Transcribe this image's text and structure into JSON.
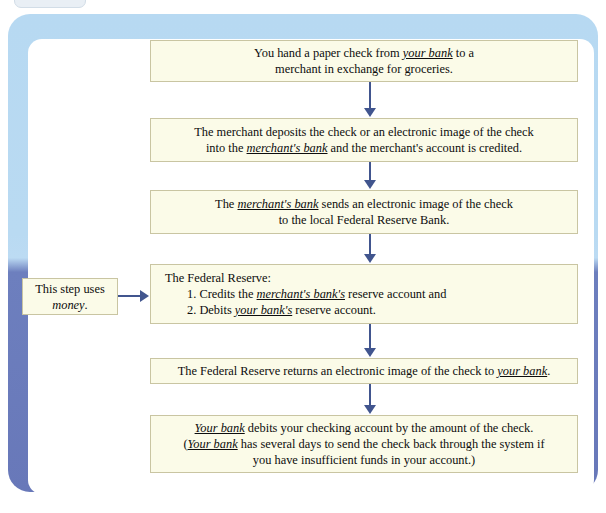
{
  "figure": {
    "type": "flowchart",
    "orientation": "vertical",
    "frame_color_top": "#b7d9f2",
    "frame_color_bottom": "#6878b9",
    "box_fill": "#fbfbe8",
    "box_border": "#c9c5a2",
    "arrow_color": "#41558e"
  },
  "top_tab": {
    "label": ""
  },
  "steps": [
    {
      "id": "step-1",
      "lines": [
        [
          {
            "text": "You hand a paper check from ",
            "style": "plain"
          },
          {
            "text": "your bank",
            "style": "term"
          },
          {
            "text": " to a",
            "style": "plain"
          }
        ],
        [
          {
            "text": "merchant in exchange for groceries.",
            "style": "plain"
          }
        ]
      ]
    },
    {
      "id": "step-2",
      "lines": [
        [
          {
            "text": "The merchant deposits the check or an electronic image of the check",
            "style": "plain"
          }
        ],
        [
          {
            "text": "into the ",
            "style": "plain"
          },
          {
            "text": "merchant's bank",
            "style": "term"
          },
          {
            "text": " and the merchant's account is credited.",
            "style": "plain"
          }
        ]
      ]
    },
    {
      "id": "step-3",
      "lines": [
        [
          {
            "text": "The ",
            "style": "plain"
          },
          {
            "text": "merchant's bank",
            "style": "term"
          },
          {
            "text": " sends an electronic image of the check",
            "style": "plain"
          }
        ],
        [
          {
            "text": "to the local Federal Reserve Bank.",
            "style": "plain"
          }
        ]
      ]
    },
    {
      "id": "step-4",
      "align": "left",
      "lines": [
        [
          {
            "text": "The Federal Reserve:",
            "style": "plain"
          }
        ],
        [
          {
            "text": "1. Credits the ",
            "style": "plain",
            "indent": true
          },
          {
            "text": "merchant's bank's",
            "style": "term"
          },
          {
            "text": " reserve account and",
            "style": "plain"
          }
        ],
        [
          {
            "text": "2. Debits ",
            "style": "plain",
            "indent": true
          },
          {
            "text": "your bank's",
            "style": "term"
          },
          {
            "text": " reserve account.",
            "style": "plain"
          }
        ]
      ]
    },
    {
      "id": "step-5",
      "lines": [
        [
          {
            "text": "The Federal Reserve returns an electronic image of the check to ",
            "style": "plain"
          },
          {
            "text": "your bank",
            "style": "term"
          },
          {
            "text": ".",
            "style": "plain"
          }
        ]
      ]
    },
    {
      "id": "step-6",
      "lines": [
        [
          {
            "text": "Your bank",
            "style": "term"
          },
          {
            "text": " debits your checking account by the amount of the check.",
            "style": "plain"
          }
        ],
        [
          {
            "text": "(",
            "style": "plain"
          },
          {
            "text": "Your bank",
            "style": "term"
          },
          {
            "text": " has several days to send the check back through the system if",
            "style": "plain"
          }
        ],
        [
          {
            "text": "you have insufficient funds in your account.)",
            "style": "plain"
          }
        ]
      ]
    }
  ],
  "callout": {
    "id": "callout-money",
    "lines": [
      [
        {
          "text": "This step uses",
          "style": "plain"
        }
      ],
      [
        {
          "text": "money",
          "style": "italic"
        },
        {
          "text": ".",
          "style": "plain"
        }
      ]
    ],
    "points_to": "step-4"
  },
  "arrows": [
    {
      "id": "arrow-1",
      "from": "step-1",
      "to": "step-2",
      "direction": "down"
    },
    {
      "id": "arrow-2",
      "from": "step-2",
      "to": "step-3",
      "direction": "down"
    },
    {
      "id": "arrow-3",
      "from": "step-3",
      "to": "step-4",
      "direction": "down"
    },
    {
      "id": "arrow-4",
      "from": "step-4",
      "to": "step-5",
      "direction": "down"
    },
    {
      "id": "arrow-5",
      "from": "step-5",
      "to": "step-6",
      "direction": "down"
    },
    {
      "id": "arrow-callout",
      "from": "callout-money",
      "to": "step-4",
      "direction": "right"
    }
  ]
}
